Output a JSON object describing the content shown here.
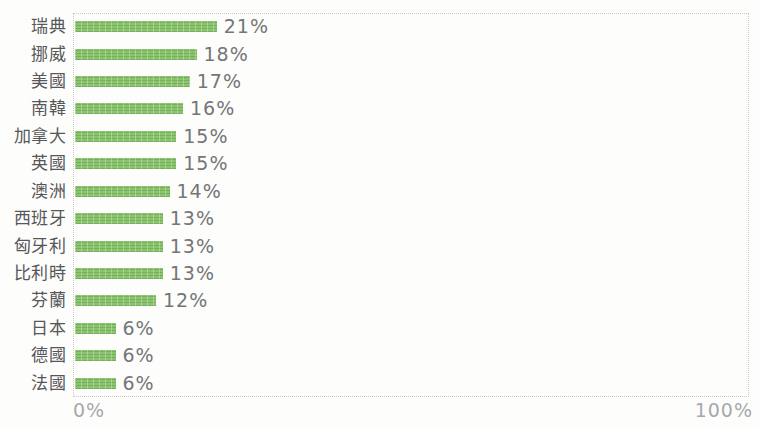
{
  "chart_data": {
    "type": "bar",
    "orientation": "horizontal",
    "title": "",
    "xlabel": "",
    "ylabel": "",
    "xlim": [
      0,
      100
    ],
    "grid": false,
    "legend": false,
    "bar_color": "#7fbd62",
    "categories": [
      "瑞典",
      "挪威",
      "美國",
      "南韓",
      "加拿大",
      "英國",
      "澳洲",
      "西班牙",
      "匈牙利",
      "比利時",
      "芬蘭",
      "日本",
      "德國",
      "法國"
    ],
    "values": [
      21,
      18,
      17,
      16,
      15,
      15,
      14,
      13,
      13,
      13,
      12,
      6,
      6,
      6
    ],
    "value_labels": [
      "21%",
      "18%",
      "17%",
      "16%",
      "15%",
      "15%",
      "14%",
      "13%",
      "13%",
      "13%",
      "12%",
      "6%",
      "6%",
      "6%"
    ],
    "x_axis_ticks": [
      "0%",
      "100%"
    ]
  },
  "axis": {
    "x_min_label": "0%",
    "x_max_label": "100%"
  },
  "colors": {
    "bar": "#7fbd62",
    "category_label": "#55575a",
    "value_label": "#737678",
    "axis_label": "#a6a9ab",
    "plot_border": "#c8cbc8",
    "background": "#fdfdfb"
  }
}
